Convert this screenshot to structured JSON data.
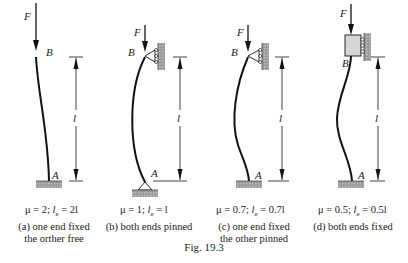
{
  "figure": {
    "caption": "Fig. 19.3",
    "labels": {
      "force": "F",
      "top": "B",
      "bottom": "A",
      "length": "l"
    },
    "cases": [
      {
        "id": "a",
        "mu": "μ = 2;",
        "le_sym": "l",
        "le_sub": "e",
        "le_val": " = 2l",
        "desc_line1": "(a) one end fixed",
        "desc_line2": "the orther free"
      },
      {
        "id": "b",
        "mu": "μ = 1;",
        "le_sym": "l",
        "le_sub": "e",
        "le_val": " = l",
        "desc_line1": "(b) both ends pinned",
        "desc_line2": ""
      },
      {
        "id": "c",
        "mu": "μ = 0.7;",
        "le_sym": "l",
        "le_sub": "e",
        "le_val": " = 0.7l",
        "desc_line1": "(c) one end fixed",
        "desc_line2": "the other pinned"
      },
      {
        "id": "d",
        "mu": "μ = 0.5;",
        "le_sym": "l",
        "le_sub": "e",
        "le_val": " = 0.5l",
        "desc_line1": "(d) both ends fixed",
        "desc_line2": ""
      }
    ]
  }
}
